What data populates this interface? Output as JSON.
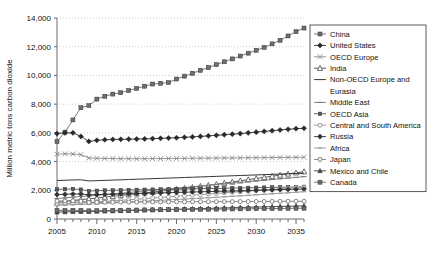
{
  "chart_data": {
    "type": "line",
    "title": "",
    "xlabel": "",
    "ylabel": "Million metric tons carbon dioxide",
    "xlim": [
      2005,
      2036
    ],
    "ylim": [
      0,
      14000
    ],
    "ytick_labels": [
      "0",
      "2,000",
      "4,000",
      "6,000",
      "8,000",
      "10,000",
      "12,000",
      "14,000"
    ],
    "ytick_values": [
      0,
      2000,
      4000,
      6000,
      8000,
      10000,
      12000,
      14000
    ],
    "xtick_labels": [
      "2005",
      "2010",
      "2015",
      "2020",
      "2025",
      "2030",
      "2035"
    ],
    "xtick_values": [
      2005,
      2010,
      2015,
      2020,
      2025,
      2030,
      2035
    ],
    "grid": true,
    "legend_position": "right",
    "x": [
      2005,
      2006,
      2007,
      2008,
      2009,
      2010,
      2011,
      2012,
      2013,
      2014,
      2015,
      2016,
      2017,
      2018,
      2019,
      2020,
      2021,
      2022,
      2023,
      2024,
      2025,
      2026,
      2027,
      2028,
      2029,
      2030,
      2031,
      2032,
      2033,
      2034,
      2035,
      2036
    ],
    "series": [
      {
        "name": "China",
        "marker": "square",
        "color": "#6e6e6e",
        "values": [
          5400,
          6050,
          6900,
          7750,
          7900,
          8350,
          8550,
          8700,
          8800,
          8950,
          9100,
          9250,
          9400,
          9450,
          9500,
          9750,
          9950,
          10150,
          10350,
          10550,
          10750,
          10950,
          11150,
          11350,
          11550,
          11750,
          11950,
          12200,
          12450,
          12750,
          13050,
          13300
        ]
      },
      {
        "name": "United States",
        "marker": "diamond",
        "color": "#2a2a2a",
        "values": [
          5950,
          6000,
          6000,
          5750,
          5400,
          5480,
          5520,
          5540,
          5550,
          5560,
          5570,
          5580,
          5600,
          5620,
          5640,
          5660,
          5690,
          5720,
          5750,
          5790,
          5830,
          5870,
          5910,
          5950,
          6000,
          6050,
          6100,
          6150,
          6200,
          6250,
          6290,
          6320
        ]
      },
      {
        "name": "OECD Europe",
        "marker": "x",
        "color": "#8a8a8a",
        "values": [
          4520,
          4540,
          4530,
          4480,
          4250,
          4230,
          4220,
          4210,
          4200,
          4200,
          4200,
          4200,
          4205,
          4210,
          4215,
          4220,
          4225,
          4230,
          4235,
          4240,
          4245,
          4250,
          4255,
          4260,
          4265,
          4270,
          4275,
          4280,
          4285,
          4290,
          4295,
          4300
        ]
      },
      {
        "name": "India",
        "marker": "triangle",
        "color": "#4a4a4a",
        "values": [
          1150,
          1220,
          1290,
          1350,
          1400,
          1460,
          1520,
          1580,
          1640,
          1700,
          1760,
          1820,
          1880,
          1940,
          2000,
          2070,
          2140,
          2210,
          2280,
          2350,
          2420,
          2500,
          2580,
          2660,
          2740,
          2820,
          2900,
          2980,
          3060,
          3140,
          3220,
          3300
        ]
      },
      {
        "name": "Non-OECD Europe and Eurasia",
        "marker": "none",
        "color": "#1f1f1f",
        "values": [
          2680,
          2700,
          2720,
          2730,
          2650,
          2670,
          2690,
          2710,
          2730,
          2750,
          2770,
          2790,
          2810,
          2830,
          2850,
          2870,
          2890,
          2910,
          2930,
          2950,
          2970,
          2990,
          3010,
          3030,
          3050,
          3070,
          3090,
          3110,
          3130,
          3150,
          3170,
          3190
        ]
      },
      {
        "name": "Middle East",
        "marker": "dash",
        "color": "#7d7d7d",
        "values": [
          1420,
          1470,
          1520,
          1570,
          1610,
          1650,
          1700,
          1750,
          1800,
          1850,
          1900,
          1950,
          2000,
          2050,
          2100,
          2150,
          2200,
          2250,
          2300,
          2350,
          2400,
          2450,
          2500,
          2550,
          2600,
          2650,
          2700,
          2750,
          2800,
          2850,
          2900,
          2950
        ]
      },
      {
        "name": "OECD Asia",
        "marker": "square-small",
        "color": "#5a5a5a",
        "values": [
          2060,
          2080,
          2090,
          2050,
          1950,
          1970,
          1990,
          2000,
          2010,
          2020,
          2030,
          2040,
          2050,
          2060,
          2070,
          2080,
          2090,
          2100,
          2110,
          2120,
          2130,
          2140,
          2150,
          2160,
          2170,
          2180,
          2190,
          2200,
          2210,
          2220,
          2230,
          2240
        ]
      },
      {
        "name": "Central and South America",
        "marker": "circle",
        "color": "#8e8e8e",
        "values": [
          1020,
          1060,
          1100,
          1130,
          1140,
          1180,
          1220,
          1260,
          1300,
          1340,
          1380,
          1420,
          1460,
          1500,
          1540,
          1580,
          1620,
          1660,
          1700,
          1740,
          1780,
          1820,
          1860,
          1900,
          1940,
          1980,
          2020,
          2060,
          2100,
          2140,
          2180,
          2220
        ]
      },
      {
        "name": "Russia",
        "marker": "diamond",
        "color": "#333333",
        "values": [
          1700,
          1720,
          1740,
          1750,
          1680,
          1700,
          1715,
          1730,
          1745,
          1760,
          1775,
          1790,
          1805,
          1820,
          1835,
          1850,
          1865,
          1880,
          1895,
          1910,
          1925,
          1940,
          1955,
          1970,
          1985,
          2000,
          2015,
          2030,
          2045,
          2060,
          2075,
          2090
        ]
      },
      {
        "name": "Africa",
        "marker": "dash",
        "color": "#9a9a9a",
        "values": [
          950,
          975,
          1000,
          1020,
          1030,
          1060,
          1090,
          1120,
          1150,
          1180,
          1210,
          1240,
          1270,
          1300,
          1330,
          1360,
          1390,
          1420,
          1450,
          1480,
          1510,
          1545,
          1580,
          1615,
          1650,
          1685,
          1720,
          1755,
          1790,
          1825,
          1860,
          1900
        ]
      },
      {
        "name": "Japan",
        "marker": "circle",
        "color": "#767676",
        "values": [
          1250,
          1260,
          1265,
          1240,
          1150,
          1160,
          1165,
          1170,
          1175,
          1180,
          1182,
          1185,
          1188,
          1190,
          1192,
          1195,
          1198,
          1200,
          1202,
          1205,
          1208,
          1210,
          1212,
          1215,
          1218,
          1220,
          1222,
          1225,
          1228,
          1230,
          1232,
          1235
        ]
      },
      {
        "name": "Mexico and Chile",
        "marker": "triangle-small",
        "color": "#3c3c3c",
        "values": [
          480,
          495,
          510,
          520,
          515,
          530,
          545,
          560,
          575,
          590,
          605,
          620,
          635,
          650,
          665,
          680,
          695,
          710,
          725,
          740,
          755,
          770,
          785,
          800,
          815,
          830,
          845,
          860,
          875,
          890,
          905,
          920
        ]
      },
      {
        "name": "Canada",
        "marker": "square",
        "color": "#6a6a6a",
        "values": [
          590,
          600,
          605,
          600,
          570,
          580,
          590,
          600,
          610,
          618,
          625,
          632,
          638,
          644,
          650,
          656,
          662,
          668,
          674,
          680,
          686,
          692,
          698,
          704,
          710,
          716,
          722,
          728,
          734,
          740,
          746,
          752
        ]
      }
    ]
  }
}
